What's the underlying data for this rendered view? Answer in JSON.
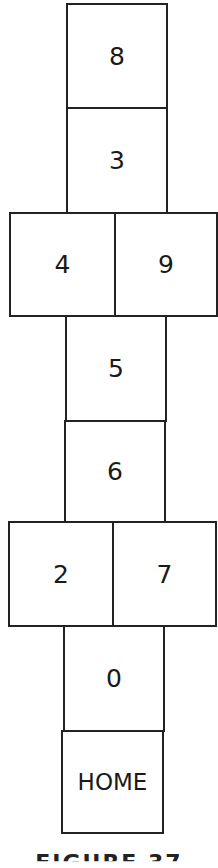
{
  "diagram": {
    "type": "hopscotch-court",
    "squares": [
      {
        "label": "8"
      },
      {
        "label": "3"
      },
      {
        "label": "4"
      },
      {
        "label": "9"
      },
      {
        "label": "5"
      },
      {
        "label": "6"
      },
      {
        "label": "2"
      },
      {
        "label": "7"
      },
      {
        "label": "0"
      },
      {
        "label": "HOME"
      }
    ],
    "caption": "FIGURE 37"
  }
}
